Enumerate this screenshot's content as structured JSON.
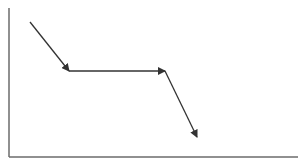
{
  "diagram": {
    "type": "piecewise-arrow-path",
    "axes": {
      "color": "#6b6b6b",
      "origin": [
        9,
        157
      ],
      "y_top": 8,
      "x_right": 298
    },
    "arrow_color": "#333333",
    "segments": [
      {
        "from": [
          30,
          22
        ],
        "to": [
          69,
          71
        ],
        "direction": "down-right"
      },
      {
        "from": [
          69,
          71
        ],
        "to": [
          165,
          71
        ],
        "direction": "right"
      },
      {
        "from": [
          165,
          71
        ],
        "to": [
          197,
          137
        ],
        "direction": "down-right"
      }
    ]
  }
}
